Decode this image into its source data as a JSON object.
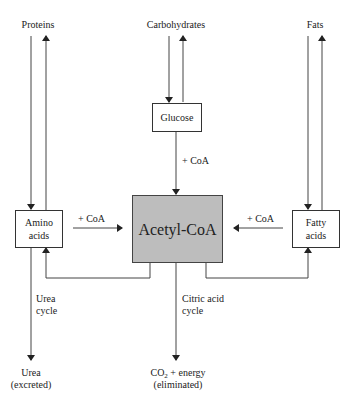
{
  "diagram": {
    "sources": {
      "proteins": "Proteins",
      "carbohydrates": "Carbohydrates",
      "fats": "Fats"
    },
    "nodes": {
      "glucose": "Glucose",
      "amino_line1": "Amino",
      "amino_line2": "acids",
      "acetyl_coa": "Acetyl-CoA",
      "fatty_line1": "Fatty",
      "fatty_line2": "acids"
    },
    "edge_labels": {
      "glucose_coa": "+ CoA",
      "amino_coa": "+ CoA",
      "fatty_coa": "+ CoA",
      "urea_cycle_line1": "Urea",
      "urea_cycle_line2": "cycle",
      "citric_line1": "Citric acid",
      "citric_line2": "cycle"
    },
    "outputs": {
      "urea_line1": "Urea",
      "urea_line2": "(excreted)",
      "co2_prefix": "CO",
      "co2_sub": "2",
      "co2_suffix": " + energy",
      "co2_line2": "(eliminated)"
    },
    "colors": {
      "acetyl_fill": "#bdbdbd",
      "line": "#333333"
    }
  }
}
